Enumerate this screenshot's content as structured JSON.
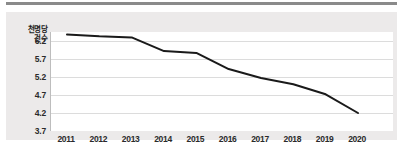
{
  "chart_data": {
    "type": "line",
    "title": "",
    "subtitle": "",
    "xlabel": "",
    "ylabel": "천명당 건수",
    "ylabel_lines": [
      "천명당",
      "건수"
    ],
    "categories": [
      "2011",
      "2012",
      "2013",
      "2014",
      "2015",
      "2016",
      "2017",
      "2018",
      "2019",
      "2020"
    ],
    "x": [
      2011,
      2012,
      2013,
      2014,
      2015,
      2016,
      2017,
      2018,
      2019,
      2020
    ],
    "values": [
      6.38,
      6.33,
      6.3,
      5.92,
      5.87,
      5.42,
      5.17,
      5.0,
      4.72,
      4.2
    ],
    "series": [
      {
        "name": "천명당 건수",
        "values": [
          6.38,
          6.33,
          6.3,
          5.92,
          5.87,
          5.42,
          5.17,
          5.0,
          4.72,
          4.2
        ],
        "color": "#1a1a1a"
      }
    ],
    "ylim": [
      3.7,
      6.45
    ],
    "yticks": [
      6.2,
      5.7,
      5.2,
      4.7,
      4.2,
      3.7
    ],
    "ytick_labels": [
      "6.2",
      "5.7",
      "5.2",
      "4.7",
      "4.2",
      "3.7"
    ],
    "xtick_labels": [
      "2011",
      "2012",
      "2013",
      "2014",
      "2015",
      "2016",
      "2017",
      "2018",
      "2019",
      "2020"
    ],
    "grid": true,
    "grid_axis": "y",
    "legend": false,
    "legend_position": "none",
    "annotations": [],
    "colors": {
      "line": "#1a1a1a",
      "gridline": "#dcdcdc",
      "plot_background": "#ffffff",
      "card_background": "#eceaea",
      "axis": "#bdbdbd",
      "text": "#2a2a2a",
      "top_rule": "#8a8a8a"
    }
  }
}
